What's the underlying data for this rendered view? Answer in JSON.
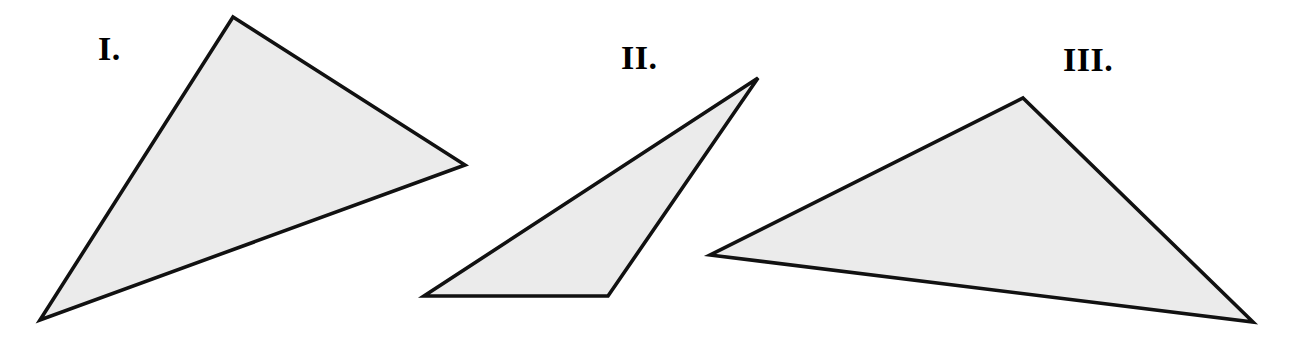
{
  "figure": {
    "background_color": "#ffffff",
    "fill_color": "#ebebeb",
    "stroke_color": "#111111",
    "stroke_width": 3.6,
    "width": 1291,
    "height": 345,
    "shapes": [
      {
        "id": "triangle-1",
        "label": "I.",
        "label_x": 98,
        "label_y": 32,
        "points": "233,17 465,165 40,320",
        "vertices": [
          [
            233,
            17
          ],
          [
            465,
            165
          ],
          [
            40,
            320
          ]
        ]
      },
      {
        "id": "triangle-2",
        "label": "II.",
        "label_x": 621,
        "label_y": 41,
        "points": "758,78 608,296 424,296",
        "vertices": [
          [
            758,
            78
          ],
          [
            608,
            296
          ],
          [
            424,
            296
          ]
        ]
      },
      {
        "id": "triangle-3",
        "label": "III.",
        "label_x": 1063,
        "label_y": 43,
        "points": "1023,98 1253,322 710,255",
        "vertices": [
          [
            1023,
            98
          ],
          [
            1253,
            322
          ],
          [
            710,
            255
          ]
        ]
      }
    ]
  }
}
